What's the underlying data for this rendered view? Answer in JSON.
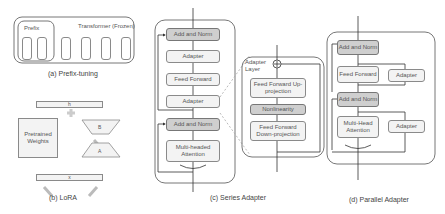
{
  "panels": {
    "prefix": {
      "caption": "(a) Prefix-tuning",
      "prefix_label": "Prefix",
      "transformer_label": "Transformer (Frozen)"
    },
    "lora": {
      "caption": "(b) LoRA",
      "h_label": "h",
      "x_label": "x",
      "weights_label": "Pretrained Weights",
      "b_label": "B",
      "a_label": "A"
    },
    "series": {
      "caption": "(c) Series Adapter",
      "blocks": [
        "Add and Norm",
        "Adapter",
        "Feed Forward",
        "Adapter",
        "Add and Norm",
        "Multi-headed Attention"
      ],
      "adapter_layer": {
        "title": "Adapter Layer",
        "blocks": [
          "Feed Forward Up-projection",
          "Nonlinearity",
          "Feed Forward Down-projection"
        ]
      }
    },
    "parallel": {
      "caption": "(d) Parallel Adapter",
      "blocks": [
        "Add and Norm",
        "Feed Forward",
        "Adapter",
        "Add and Norm",
        "Multi-Head Attention",
        "Adapter"
      ]
    }
  },
  "colors": {
    "frozen_dark": "#cfcfcf",
    "block_light": "#f3f3f3",
    "border": "#8a8a8a"
  }
}
